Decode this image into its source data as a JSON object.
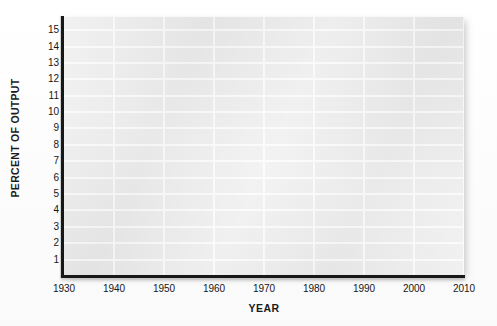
{
  "chart_data": {
    "type": "line",
    "title": "",
    "subtitle": "",
    "xlabel": "YEAR",
    "ylabel": "PERCENT OF OUTPUT",
    "xlim": [
      1930,
      2010
    ],
    "ylim": [
      0,
      15.8
    ],
    "xticks": [
      1930,
      1940,
      1950,
      1960,
      1970,
      1980,
      1990,
      2000,
      2010
    ],
    "xtick_labels": [
      "1930",
      "1940",
      "1950",
      "1960",
      "1970",
      "1980",
      "1990",
      "2000",
      "2010"
    ],
    "yticks": [
      1,
      2,
      3,
      4,
      5,
      6,
      7,
      8,
      9,
      10,
      11,
      12,
      13,
      14,
      15
    ],
    "ytick_labels": [
      "15",
      "14",
      "13",
      "12",
      "11",
      "10",
      "9",
      "8",
      "7",
      "6",
      "5",
      "4",
      "3",
      "2",
      "1"
    ],
    "grid": true,
    "grid_axis": "both",
    "legend": false,
    "legend_position": "none",
    "series": [],
    "values": [],
    "annotations": [],
    "note": "Empty chart template: axes and gridlines only, no plotted data series"
  },
  "style": {
    "plot_background": "#ebebeb",
    "gridline_color": "#fbfbfb",
    "axis_color": "#171717",
    "text_color": "#161616",
    "figure_background": "#ffffff"
  }
}
